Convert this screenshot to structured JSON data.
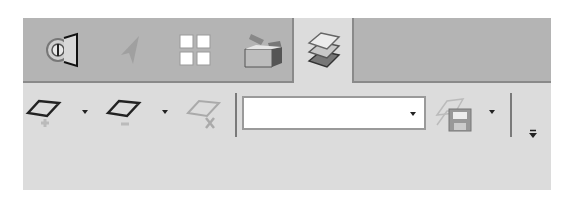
{
  "tabs": [
    {
      "id": "tab-connect",
      "icon": "connector-icon",
      "active": false
    },
    {
      "id": "tab-cursor",
      "icon": "cursor-arrow-icon",
      "active": false
    },
    {
      "id": "tab-grid",
      "icon": "grid-icon",
      "active": false
    },
    {
      "id": "tab-box",
      "icon": "open-box-icon",
      "active": false
    },
    {
      "id": "tab-layers",
      "icon": "layers-icon",
      "active": true
    }
  ],
  "toolbar": {
    "add_layer": {
      "icon": "add-layer-icon",
      "has_dropdown": true
    },
    "remove_layer": {
      "icon": "remove-layer-icon",
      "has_dropdown": true
    },
    "delete_layer": {
      "icon": "delete-layer-icon",
      "enabled": false
    },
    "layer_combo": {
      "value": "",
      "placeholder": ""
    },
    "save_layers": {
      "icon": "save-layers-icon",
      "has_dropdown": true,
      "enabled": false
    },
    "overflow": {
      "icon": "overflow-chevron-icon"
    }
  },
  "colors": {
    "tabstrip_bg": "#b4b4b4",
    "panel_bg": "#dcdcdc",
    "border": "#8a8a8a"
  }
}
